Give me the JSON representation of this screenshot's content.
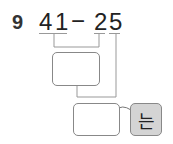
{
  "problem": {
    "number": "9",
    "expression": {
      "minuend_tens": "4",
      "minuend_ones": "1",
      "operator": "−",
      "subtrahend_tens": "2",
      "subtrahend_ones": "5"
    },
    "answer_boxes": [
      {
        "value": ""
      },
      {
        "value": ""
      }
    ],
    "suffix_label": "는"
  }
}
